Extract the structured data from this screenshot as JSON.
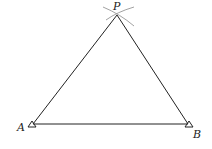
{
  "diagram": {
    "type": "geometric-construction",
    "points": {
      "P": {
        "label": "P",
        "x": 117,
        "y": 15
      },
      "A": {
        "label": "A",
        "x": 33,
        "y": 124
      },
      "B": {
        "label": "B",
        "x": 188,
        "y": 124
      }
    },
    "segments": [
      [
        "A",
        "P"
      ],
      [
        "P",
        "B"
      ],
      [
        "A",
        "B"
      ]
    ],
    "colors": {
      "line": "#222222",
      "arc": "#888888",
      "background": "#ffffff"
    }
  }
}
